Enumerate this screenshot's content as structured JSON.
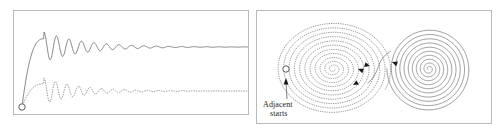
{
  "figure": {
    "background_color": "#ffffff",
    "panel_border_color": "#b9b9b9",
    "trace_color": "#6b6b6b",
    "dotted_trace_color": "#8a8a8a",
    "arrow_color": "#1a1a1a",
    "marker_color": "#4a4a4a",
    "label_color": "#1d1d1d"
  },
  "panels": [
    {
      "id": "time-series-panel",
      "position": "left",
      "description": "Two damped oscillating time traces starting from the same point"
    },
    {
      "id": "attractor-panel",
      "position": "right",
      "description": "Butterfly attractor with dotted left lobe and solid right lobe"
    }
  ],
  "annotations": {
    "adjacent_starts": {
      "line1": "Adjacent",
      "line2": "starts"
    }
  },
  "chart_data": {
    "type": "line",
    "xlabel": "",
    "ylabel": "",
    "grid": false,
    "legend": "none",
    "panels": [
      {
        "name": "time-series",
        "type": "line",
        "xlim": [
          0,
          236
        ],
        "ylim": [
          0,
          105
        ],
        "start_marker": {
          "x": 8,
          "y": 96,
          "r": 3.2,
          "shape": "open-circle"
        },
        "series": [
          {
            "name": "trajectory-a",
            "style": "solid",
            "color": "#6b6b6b",
            "baseline_y": 36,
            "settle_y": 36,
            "rise_start_x": 8,
            "rise_end_x": 30,
            "osc_start_x": 30,
            "osc_end_x": 236,
            "initial_amplitude": 15,
            "damping": 0.016,
            "period": 12.5,
            "description": "damped sinusoid settling to a steady level"
          },
          {
            "name": "trajectory-b",
            "style": "dotted",
            "color": "#8a8a8a",
            "baseline_y": 80,
            "settle_y": 80,
            "rise_start_x": 8,
            "rise_end_x": 30,
            "osc_start_x": 30,
            "osc_end_x": 236,
            "initial_amplitude": 13,
            "damping": 0.018,
            "period": 11.5,
            "description": "damped sinusoid, dotted, settling lower"
          }
        ]
      },
      {
        "name": "attractor",
        "type": "scatter",
        "xlim": [
          0,
          236
        ],
        "ylim": [
          0,
          114
        ],
        "lobes": [
          {
            "name": "left-lobe",
            "style": "dotted",
            "color": "#8a8a8a",
            "center_x": 76,
            "center_y": 58,
            "turns": 11,
            "r_max_x": 58,
            "r_max_y": 47,
            "direction": "outward"
          },
          {
            "name": "right-lobe",
            "style": "solid",
            "color": "#6b6b6b",
            "center_x": 172,
            "center_y": 58,
            "turns": 10,
            "r_max_x": 42,
            "r_max_y": 42,
            "direction": "outward"
          }
        ],
        "arrows": [
          {
            "x": 101,
            "y": 58,
            "angle": 200
          },
          {
            "x": 96,
            "y": 74,
            "angle": 150
          },
          {
            "x": 113,
            "y": 55,
            "angle": 15
          },
          {
            "x": 135,
            "y": 51,
            "angle": 200
          }
        ],
        "start_marker": {
          "x": 29,
          "y": 58,
          "r": 3.2,
          "shape": "open-circle"
        },
        "annotation_arrow": {
          "from_x": 30,
          "from_y": 88,
          "to_x": 29,
          "to_y": 64
        }
      }
    ]
  }
}
